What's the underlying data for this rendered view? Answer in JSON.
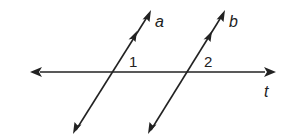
{
  "diagram": {
    "lines": [
      {
        "name": "a",
        "label": "a",
        "parallel_marks": 1
      },
      {
        "name": "b",
        "label": "b",
        "parallel_marks": 1
      },
      {
        "name": "t",
        "label": "t"
      }
    ],
    "angles": [
      {
        "label": "1",
        "at": "intersection of a and t"
      },
      {
        "label": "2",
        "at": "intersection of b and t"
      }
    ],
    "colors": {
      "stroke": "#222222",
      "background": "#ffffff"
    }
  }
}
